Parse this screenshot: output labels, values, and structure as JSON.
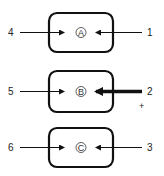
{
  "diagram": {
    "stroke_color": "#111111",
    "nodes": [
      {
        "id": "A",
        "label": "A",
        "left_input": "4",
        "right_input": "1",
        "right_emphasized": false,
        "sign": ""
      },
      {
        "id": "B",
        "label": "B",
        "left_input": "5",
        "right_input": "2",
        "right_emphasized": true,
        "sign": "+"
      },
      {
        "id": "C",
        "label": "C",
        "left_input": "6",
        "right_input": "3",
        "right_emphasized": false,
        "sign": ""
      }
    ]
  }
}
